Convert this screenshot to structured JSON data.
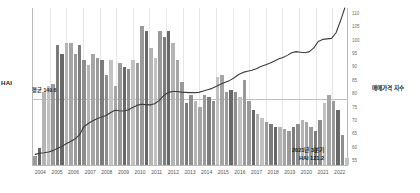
{
  "axes": {
    "left_title": "HAI",
    "right_title": "매매가격 지수",
    "left_ticks": [
      190,
      185,
      180,
      175,
      170,
      165,
      160,
      155,
      150,
      145,
      140,
      135,
      130,
      125,
      120
    ],
    "right_ticks": [
      110,
      105,
      100,
      95,
      90,
      85,
      80,
      75,
      70,
      65,
      60,
      55
    ],
    "x_ticks": [
      "2004",
      "2005",
      "2006",
      "2007",
      "2008",
      "2009",
      "2010",
      "2011",
      "2012",
      "2013",
      "2014",
      "2015",
      "2016",
      "2017",
      "2018",
      "2019",
      "2020",
      "2021",
      "2022"
    ]
  },
  "annotations": {
    "average": "평균 149.6",
    "end_line1": "2021년 3분기",
    "end_line2": "HAI 121.2"
  },
  "colors": {
    "bar": "#9a9a9a",
    "bar_dark": "#6f6f6f",
    "bar_light": "#c9c9c9",
    "line": "#3c3c3c",
    "reference": "#d9b6b6",
    "grid": "#e6e6e6",
    "axis": "#b9b9b9"
  },
  "chart_data": {
    "type": "bar",
    "title": "",
    "subtitle": "",
    "xlabel": "",
    "ylabel": "HAI",
    "y2label": "매매가격 지수",
    "ylim": [
      118,
      192
    ],
    "y2lim": [
      53,
      112
    ],
    "grid": true,
    "legend": "none",
    "reference_lines": [
      {
        "axis": "y",
        "value": 149.6,
        "label": "평균 149.6",
        "color": "#d9b6b6"
      }
    ],
    "x": [
      "2004Q1",
      "2004Q2",
      "2004Q3",
      "2004Q4",
      "2005Q1",
      "2005Q2",
      "2005Q3",
      "2005Q4",
      "2006Q1",
      "2006Q2",
      "2006Q3",
      "2006Q4",
      "2007Q1",
      "2007Q2",
      "2007Q3",
      "2007Q4",
      "2008Q1",
      "2008Q2",
      "2008Q3",
      "2008Q4",
      "2009Q1",
      "2009Q2",
      "2009Q3",
      "2009Q4",
      "2010Q1",
      "2010Q2",
      "2010Q3",
      "2010Q4",
      "2011Q1",
      "2011Q2",
      "2011Q3",
      "2011Q4",
      "2012Q1",
      "2012Q2",
      "2012Q3",
      "2012Q4",
      "2013Q1",
      "2013Q2",
      "2013Q3",
      "2013Q4",
      "2014Q1",
      "2014Q2",
      "2014Q3",
      "2014Q4",
      "2015Q1",
      "2015Q2",
      "2015Q3",
      "2015Q4",
      "2016Q1",
      "2016Q2",
      "2016Q3",
      "2016Q4",
      "2017Q1",
      "2017Q2",
      "2017Q3",
      "2017Q4",
      "2018Q1",
      "2018Q2",
      "2018Q3",
      "2018Q4",
      "2019Q1",
      "2019Q2",
      "2019Q3",
      "2019Q4",
      "2020Q1",
      "2020Q2",
      "2020Q3",
      "2020Q4",
      "2021Q1",
      "2021Q2",
      "2021Q3"
    ],
    "series": [
      {
        "name": "HAI",
        "type": "bar",
        "axis": "left",
        "values": [
          122.0,
          126.0,
          152.0,
          155.0,
          156.0,
          174.0,
          170.0,
          175.0,
          175.0,
          170.0,
          174.0,
          167.0,
          165.0,
          170.0,
          168.0,
          167.0,
          160.0,
          167.0,
          155.0,
          166.0,
          164.0,
          163.0,
          167.0,
          166.0,
          183.0,
          181.0,
          173.0,
          168.0,
          181.0,
          178.0,
          181.0,
          175.0,
          167.0,
          157.0,
          147.0,
          151.0,
          148.0,
          145.0,
          151.0,
          150.0,
          148.0,
          159.0,
          160.0,
          152.0,
          153.0,
          152.0,
          150.0,
          158.0,
          148.0,
          144.0,
          142.0,
          140.0,
          138.0,
          137.0,
          136.0,
          136.0,
          135.0,
          134.0,
          136.0,
          137.0,
          139.0,
          138.0,
          136.0,
          134.0,
          139.0,
          147.0,
          151.0,
          148.0,
          144.0,
          132.0,
          121.2
        ]
      },
      {
        "name": "매매가격 지수",
        "type": "line",
        "axis": "right",
        "values": [
          57.0,
          57.4,
          57.6,
          57.9,
          58.4,
          59.2,
          60.0,
          61.0,
          61.8,
          62.8,
          64.3,
          67.4,
          68.6,
          69.6,
          70.4,
          71.0,
          71.6,
          72.6,
          73.6,
          73.4,
          73.3,
          73.7,
          74.6,
          75.4,
          75.8,
          75.7,
          75.6,
          76.0,
          77.2,
          79.0,
          80.2,
          80.6,
          80.6,
          80.4,
          80.3,
          80.2,
          80.2,
          80.3,
          80.8,
          81.3,
          81.8,
          82.6,
          83.4,
          84.1,
          84.8,
          85.8,
          87.0,
          87.8,
          88.2,
          88.6,
          89.2,
          90.0,
          90.6,
          91.2,
          92.0,
          92.8,
          93.4,
          94.2,
          95.2,
          95.6,
          95.4,
          95.2,
          95.6,
          97.0,
          99.4,
          100.2,
          100.4,
          100.6,
          102.6,
          107.0,
          112.0
        ]
      }
    ]
  }
}
